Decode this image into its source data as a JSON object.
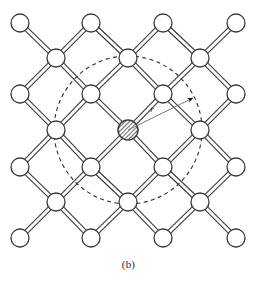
{
  "figure": {
    "caption": "(b)",
    "radius_label": "r",
    "colors": {
      "stroke": "#3a3a3a",
      "atom_fill": "#ffffff",
      "center_atom_hatch": "#4a4a4a",
      "dashed_circle": "#2f2f2f",
      "arrow": "#111111",
      "background": "#ffffff"
    },
    "icons": {
      "atom": "atom-circle-icon",
      "center_atom": "hatched-atom-icon",
      "bond": "double-line-bond-icon",
      "radius_arrow": "radius-arrow-icon",
      "cutoff_circle": "dashed-cutoff-circle-icon"
    }
  },
  "chart_data": {
    "type": "scatter",
    "title": "",
    "subtitle": "",
    "xlabel": "",
    "ylabel": "",
    "xlim": [
      0,
      257
    ],
    "ylim": [
      0,
      262
    ],
    "grid": false,
    "legend": null,
    "annotations": [
      {
        "text": "r",
        "x": 152,
        "y": 112
      },
      {
        "text": "(b)",
        "x": 128,
        "y": 268
      }
    ],
    "atom_radius": 9,
    "center_atom_radius": 10,
    "cutoff_circle": {
      "cx": 128,
      "cy": 130,
      "r": 74,
      "style": "dashed"
    },
    "radius_arrow": {
      "x1": 128,
      "y1": 130,
      "x2": 193,
      "y2": 98
    },
    "lattice_rows": [
      {
        "y": 23,
        "x": [
          20,
          91,
          163,
          236
        ]
      },
      {
        "y": 58,
        "x": [
          56,
          128,
          200
        ]
      },
      {
        "y": 94,
        "x": [
          20,
          91,
          163,
          236
        ]
      },
      {
        "y": 130,
        "x": [
          56,
          128,
          200
        ]
      },
      {
        "y": 167,
        "x": [
          20,
          91,
          163,
          236
        ]
      },
      {
        "y": 202,
        "x": [
          56,
          128,
          200
        ]
      },
      {
        "y": 238,
        "x": [
          20,
          91,
          163,
          236
        ]
      }
    ],
    "center_atom": {
      "x": 128,
      "y": 130
    },
    "atoms": [
      {
        "x": 20,
        "y": 23
      },
      {
        "x": 91,
        "y": 23
      },
      {
        "x": 163,
        "y": 23
      },
      {
        "x": 236,
        "y": 23
      },
      {
        "x": 56,
        "y": 58
      },
      {
        "x": 128,
        "y": 58
      },
      {
        "x": 200,
        "y": 58
      },
      {
        "x": 20,
        "y": 94
      },
      {
        "x": 91,
        "y": 94
      },
      {
        "x": 163,
        "y": 94
      },
      {
        "x": 236,
        "y": 94
      },
      {
        "x": 56,
        "y": 130
      },
      {
        "x": 200,
        "y": 130
      },
      {
        "x": 20,
        "y": 167
      },
      {
        "x": 91,
        "y": 167
      },
      {
        "x": 163,
        "y": 167
      },
      {
        "x": 236,
        "y": 167
      },
      {
        "x": 56,
        "y": 202
      },
      {
        "x": 128,
        "y": 202
      },
      {
        "x": 200,
        "y": 202
      },
      {
        "x": 20,
        "y": 238
      },
      {
        "x": 91,
        "y": 238
      },
      {
        "x": 163,
        "y": 238
      },
      {
        "x": 236,
        "y": 238
      }
    ],
    "bonds": [
      {
        "x1": 20,
        "y1": 23,
        "x2": 56,
        "y2": 58
      },
      {
        "x1": 91,
        "y1": 23,
        "x2": 56,
        "y2": 58
      },
      {
        "x1": 91,
        "y1": 23,
        "x2": 128,
        "y2": 58
      },
      {
        "x1": 163,
        "y1": 23,
        "x2": 128,
        "y2": 58
      },
      {
        "x1": 163,
        "y1": 23,
        "x2": 200,
        "y2": 58
      },
      {
        "x1": 236,
        "y1": 23,
        "x2": 200,
        "y2": 58
      },
      {
        "x1": 56,
        "y1": 58,
        "x2": 20,
        "y2": 94
      },
      {
        "x1": 56,
        "y1": 58,
        "x2": 91,
        "y2": 94
      },
      {
        "x1": 128,
        "y1": 58,
        "x2": 91,
        "y2": 94
      },
      {
        "x1": 128,
        "y1": 58,
        "x2": 163,
        "y2": 94
      },
      {
        "x1": 200,
        "y1": 58,
        "x2": 163,
        "y2": 94
      },
      {
        "x1": 200,
        "y1": 58,
        "x2": 236,
        "y2": 94
      },
      {
        "x1": 20,
        "y1": 94,
        "x2": 56,
        "y2": 130
      },
      {
        "x1": 91,
        "y1": 94,
        "x2": 56,
        "y2": 130
      },
      {
        "x1": 91,
        "y1": 94,
        "x2": 128,
        "y2": 130
      },
      {
        "x1": 163,
        "y1": 94,
        "x2": 128,
        "y2": 130
      },
      {
        "x1": 163,
        "y1": 94,
        "x2": 200,
        "y2": 130
      },
      {
        "x1": 236,
        "y1": 94,
        "x2": 200,
        "y2": 130
      },
      {
        "x1": 56,
        "y1": 130,
        "x2": 20,
        "y2": 167
      },
      {
        "x1": 56,
        "y1": 130,
        "x2": 91,
        "y2": 167
      },
      {
        "x1": 128,
        "y1": 130,
        "x2": 91,
        "y2": 167
      },
      {
        "x1": 128,
        "y1": 130,
        "x2": 163,
        "y2": 167
      },
      {
        "x1": 200,
        "y1": 130,
        "x2": 163,
        "y2": 167
      },
      {
        "x1": 200,
        "y1": 130,
        "x2": 236,
        "y2": 167
      },
      {
        "x1": 20,
        "y1": 167,
        "x2": 56,
        "y2": 202
      },
      {
        "x1": 91,
        "y1": 167,
        "x2": 56,
        "y2": 202
      },
      {
        "x1": 91,
        "y1": 167,
        "x2": 128,
        "y2": 202
      },
      {
        "x1": 163,
        "y1": 167,
        "x2": 128,
        "y2": 202
      },
      {
        "x1": 163,
        "y1": 167,
        "x2": 200,
        "y2": 202
      },
      {
        "x1": 236,
        "y1": 167,
        "x2": 200,
        "y2": 202
      },
      {
        "x1": 56,
        "y1": 202,
        "x2": 20,
        "y2": 238
      },
      {
        "x1": 56,
        "y1": 202,
        "x2": 91,
        "y2": 238
      },
      {
        "x1": 128,
        "y1": 202,
        "x2": 91,
        "y2": 238
      },
      {
        "x1": 128,
        "y1": 202,
        "x2": 163,
        "y2": 238
      },
      {
        "x1": 200,
        "y1": 202,
        "x2": 163,
        "y2": 238
      },
      {
        "x1": 200,
        "y1": 202,
        "x2": 236,
        "y2": 238
      }
    ]
  }
}
